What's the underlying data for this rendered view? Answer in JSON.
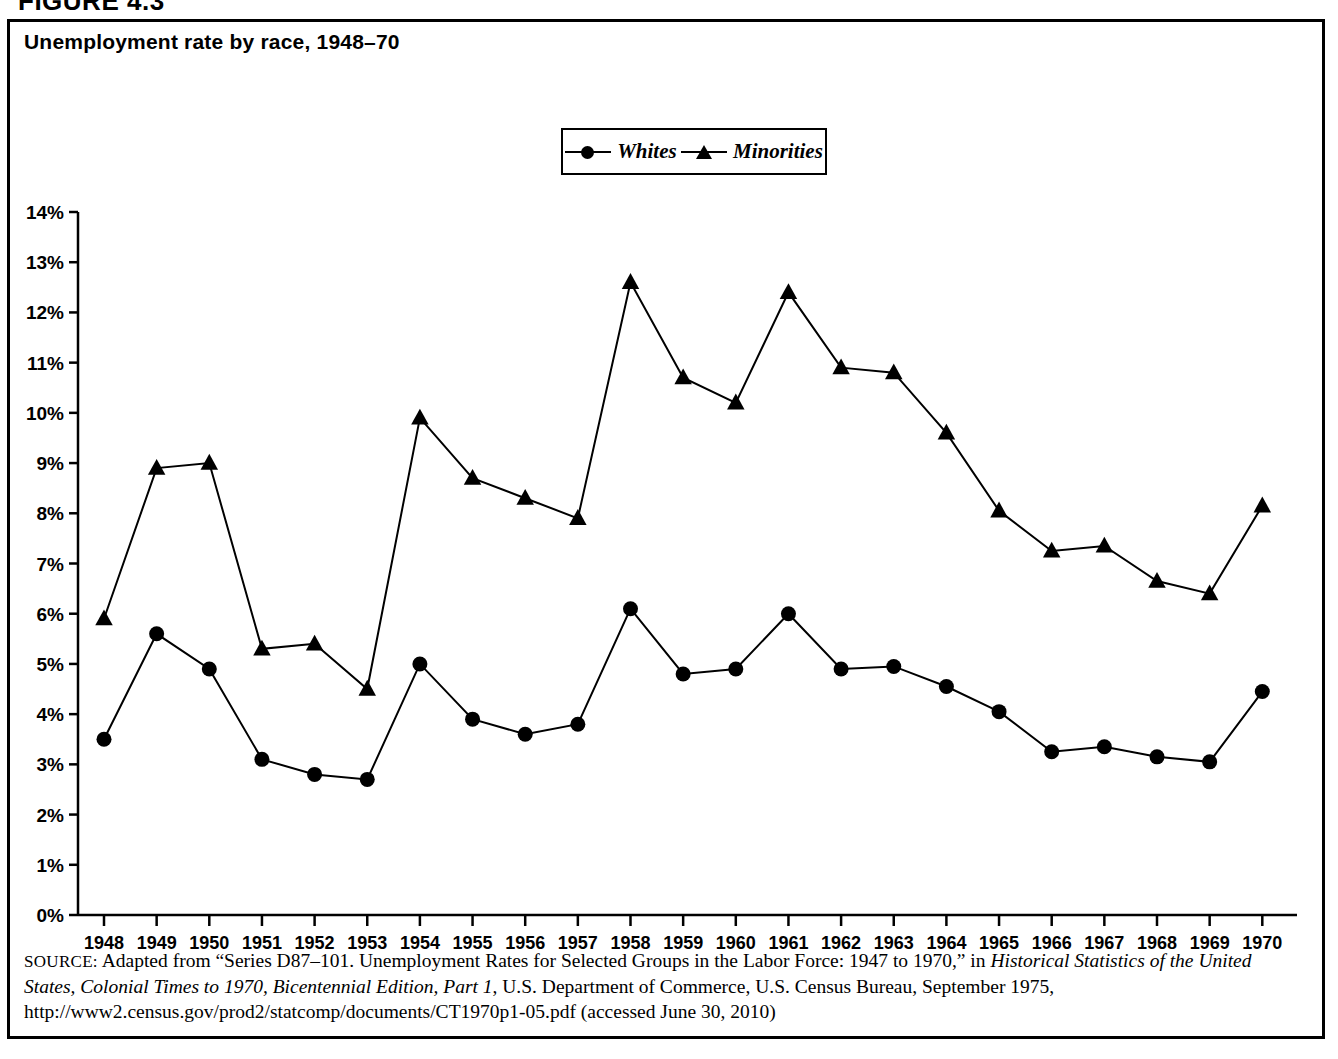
{
  "figure_label": "FIGURE 4.3",
  "chart_title": "Unemployment rate by race, 1948–70",
  "legend": {
    "items": [
      {
        "label": "Whites",
        "marker": "circle"
      },
      {
        "label": "Minorities",
        "marker": "triangle"
      }
    ]
  },
  "source": {
    "prefix": "SOURCE:",
    "line1_a": " Adapted from “Series D87–101. Unemployment Rates for Selected Groups in the Labor Force: 1947 to 1970,” in ",
    "italic1": "Historical Statistics of the United States, Colonial Times to 1970, Bicentennial Edition, Part 1",
    "line1_b": ", U.S. Department of Commerce, U.S. Census Bureau, September 1975, http://www2.census.gov/prod2/statcomp/documents/CT1970p1-05.pdf (accessed June 30, 2010)"
  },
  "chart_data": {
    "type": "line",
    "title": "Unemployment rate by race, 1948–70",
    "xlabel": "",
    "ylabel": "",
    "ylim": [
      0,
      14
    ],
    "ytick_labels": [
      "0%",
      "1%",
      "2%",
      "3%",
      "4%",
      "5%",
      "6%",
      "7%",
      "8%",
      "9%",
      "10%",
      "11%",
      "12%",
      "13%",
      "14%"
    ],
    "ytick_values": [
      0,
      1,
      2,
      3,
      4,
      5,
      6,
      7,
      8,
      9,
      10,
      11,
      12,
      13,
      14
    ],
    "grid": false,
    "legend_position": "top-center",
    "x": [
      1948,
      1949,
      1950,
      1951,
      1952,
      1953,
      1954,
      1955,
      1956,
      1957,
      1958,
      1959,
      1960,
      1961,
      1962,
      1963,
      1964,
      1965,
      1966,
      1967,
      1968,
      1969,
      1970
    ],
    "categories": [
      "1948",
      "1949",
      "1950",
      "1951",
      "1952",
      "1953",
      "1954",
      "1955",
      "1956",
      "1957",
      "1958",
      "1959",
      "1960",
      "1961",
      "1962",
      "1963",
      "1964",
      "1965",
      "1966",
      "1967",
      "1968",
      "1969",
      "1970"
    ],
    "series": [
      {
        "name": "Whites",
        "marker": "circle",
        "values": [
          3.5,
          5.6,
          4.9,
          3.1,
          2.8,
          2.7,
          5.0,
          3.9,
          3.6,
          3.8,
          6.1,
          4.8,
          4.9,
          6.0,
          4.9,
          4.95,
          4.55,
          4.05,
          3.25,
          3.35,
          3.15,
          3.05,
          4.45
        ]
      },
      {
        "name": "Minorities",
        "marker": "triangle",
        "values": [
          5.9,
          8.9,
          9.0,
          5.3,
          5.4,
          4.5,
          9.9,
          8.7,
          8.3,
          7.9,
          12.6,
          10.7,
          10.2,
          12.4,
          10.9,
          10.8,
          9.6,
          8.05,
          7.25,
          7.35,
          6.65,
          6.4,
          8.15
        ]
      }
    ]
  }
}
